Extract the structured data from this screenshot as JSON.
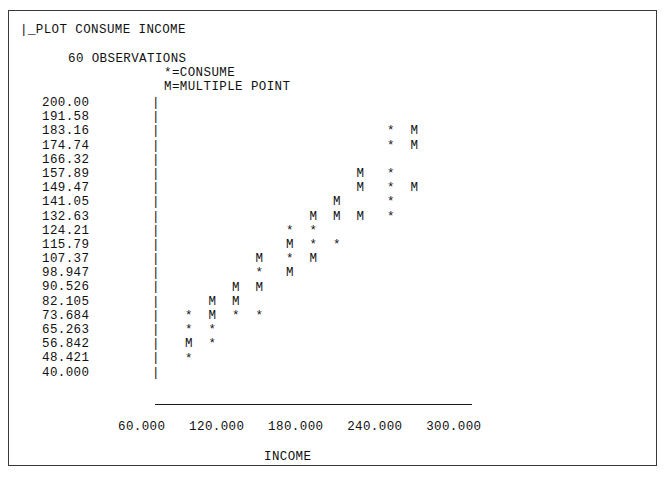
{
  "header": {
    "command": "|_PLOT CONSUME INCOME",
    "observations": "60 OBSERVATIONS",
    "legend_star": "*=CONSUME",
    "legend_multiple": "M=MULTIPLE POINT"
  },
  "axis": {
    "vertical_glyph": "|",
    "x_tick_line": "60.000   120.000   180.000   240.000   300.000",
    "x_title": "INCOME"
  },
  "chart_data": {
    "type": "scatter",
    "title": "_PLOT CONSUME INCOME",
    "subtitle": "60 OBSERVATIONS",
    "xlabel": "INCOME",
    "ylabel": "CONSUME",
    "grid": false,
    "legend_position": "top",
    "legend": [
      {
        "symbol": "*",
        "label": "=CONSUME"
      },
      {
        "symbol": "M",
        "label": "=MULTIPLE POINT"
      }
    ],
    "n_observations": 60,
    "ylim": [
      40.0,
      200.0
    ],
    "xlim": [
      30.0,
      330.0
    ],
    "y_ticks": [
      "200.00",
      "191.58",
      "183.16",
      "174.74",
      "166.32",
      "157.89",
      "149.47",
      "141.05",
      "132.63",
      "124.21",
      "115.79",
      "107.37",
      "98.947",
      "90.526",
      "82.105",
      "73.684",
      "65.263",
      "56.842",
      "48.421",
      "40.000"
    ],
    "x_ticks": [
      "60.000",
      "120.000",
      "180.000",
      "240.000",
      "300.000"
    ],
    "rows": [
      {
        "y": "200.00",
        "marks": []
      },
      {
        "y": "191.58",
        "marks": []
      },
      {
        "y": "183.16",
        "marks": [
          {
            "col": 8.6,
            "s": "*"
          },
          {
            "col": 9.6,
            "s": "M"
          }
        ]
      },
      {
        "y": "174.74",
        "marks": [
          {
            "col": 8.6,
            "s": "*"
          },
          {
            "col": 9.6,
            "s": "M"
          }
        ]
      },
      {
        "y": "166.32",
        "marks": []
      },
      {
        "y": "157.89",
        "marks": [
          {
            "col": 7.3,
            "s": "M"
          },
          {
            "col": 8.6,
            "s": "*"
          }
        ]
      },
      {
        "y": "149.47",
        "marks": [
          {
            "col": 7.3,
            "s": "M"
          },
          {
            "col": 8.6,
            "s": "*"
          },
          {
            "col": 9.6,
            "s": "M"
          }
        ]
      },
      {
        "y": "141.05",
        "marks": [
          {
            "col": 6.3,
            "s": "M"
          },
          {
            "col": 8.6,
            "s": "*"
          }
        ]
      },
      {
        "y": "132.63",
        "marks": [
          {
            "col": 5.3,
            "s": "M"
          },
          {
            "col": 6.3,
            "s": "M"
          },
          {
            "col": 7.3,
            "s": "M"
          },
          {
            "col": 8.6,
            "s": "*"
          }
        ]
      },
      {
        "y": "124.21",
        "marks": [
          {
            "col": 4.3,
            "s": "*"
          },
          {
            "col": 5.3,
            "s": "*"
          }
        ]
      },
      {
        "y": "115.79",
        "marks": [
          {
            "col": 4.3,
            "s": "M"
          },
          {
            "col": 5.3,
            "s": "*"
          },
          {
            "col": 6.3,
            "s": "*"
          }
        ]
      },
      {
        "y": "107.37",
        "marks": [
          {
            "col": 3.0,
            "s": "M"
          },
          {
            "col": 4.3,
            "s": "*"
          },
          {
            "col": 5.3,
            "s": "M"
          }
        ]
      },
      {
        "y": "98.947",
        "marks": [
          {
            "col": 3.0,
            "s": "*"
          },
          {
            "col": 4.3,
            "s": "M"
          }
        ]
      },
      {
        "y": "90.526",
        "marks": [
          {
            "col": 2.0,
            "s": "M"
          },
          {
            "col": 3.0,
            "s": "M"
          }
        ]
      },
      {
        "y": "82.105",
        "marks": [
          {
            "col": 1.0,
            "s": "M"
          },
          {
            "col": 2.0,
            "s": "M"
          }
        ]
      },
      {
        "y": "73.684",
        "marks": [
          {
            "col": 0.0,
            "s": "*"
          },
          {
            "col": 1.0,
            "s": "M"
          },
          {
            "col": 2.0,
            "s": "*"
          },
          {
            "col": 3.0,
            "s": "*"
          }
        ]
      },
      {
        "y": "65.263",
        "marks": [
          {
            "col": 0.0,
            "s": "*"
          },
          {
            "col": 1.0,
            "s": "*"
          }
        ]
      },
      {
        "y": "56.842",
        "marks": [
          {
            "col": 0.0,
            "s": "M"
          },
          {
            "col": 1.0,
            "s": "*"
          }
        ]
      },
      {
        "y": "48.421",
        "marks": [
          {
            "col": 0.0,
            "s": "*"
          }
        ]
      },
      {
        "y": "40.000",
        "marks": []
      }
    ]
  },
  "colors": {
    "ink": "#111111",
    "frame": "#3a3a3a",
    "paper": "#ffffff"
  }
}
